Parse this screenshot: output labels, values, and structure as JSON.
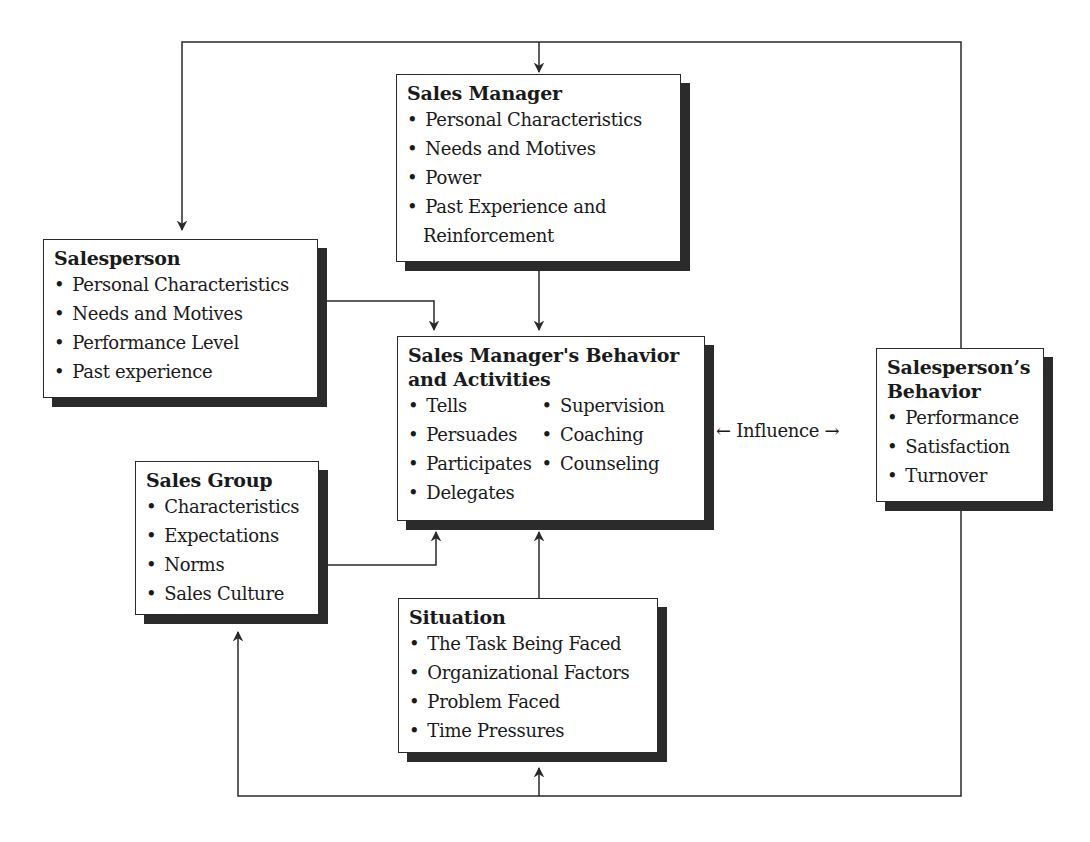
{
  "diagram": {
    "nodes": {
      "sales_manager": {
        "title": "Sales Manager",
        "items": [
          "Personal Characteristics",
          "Needs and Motives",
          "Power",
          "Past Experience and",
          "Reinforcement"
        ]
      },
      "salesperson": {
        "title": "Salesperson",
        "items": [
          "Personal Characteristics",
          "Needs and Motives",
          "Performance Level",
          "Past experience"
        ]
      },
      "manager_behavior": {
        "title_line1": "Sales Manager's Behavior",
        "title_line2": "and Activities",
        "items_left": [
          "Tells",
          "Persuades",
          "Participates",
          "Delegates"
        ],
        "items_right": [
          "Supervision",
          "Coaching",
          "Counseling"
        ]
      },
      "salesperson_behavior": {
        "title_line1": "Salesperson’s",
        "title_line2": "Behavior",
        "items": [
          "Performance",
          "Satisfaction",
          "Turnover"
        ]
      },
      "sales_group": {
        "title": "Sales Group",
        "items": [
          "Characteristics",
          "Expectations",
          "Norms",
          "Sales Culture"
        ]
      },
      "situation": {
        "title": "Situation",
        "items": [
          "The Task Being Faced",
          "Organizational Factors",
          "Problem Faced",
          "Time Pressures"
        ]
      }
    },
    "influence_label": "← Influence →",
    "edges": [
      {
        "from": "salesperson_behavior",
        "to": "sales_manager",
        "type": "feedback-top"
      },
      {
        "from": "salesperson_behavior",
        "to": "salesperson",
        "type": "feedback-top"
      },
      {
        "from": "sales_manager",
        "to": "manager_behavior"
      },
      {
        "from": "salesperson",
        "to": "manager_behavior"
      },
      {
        "from": "sales_group",
        "to": "manager_behavior"
      },
      {
        "from": "situation",
        "to": "manager_behavior"
      },
      {
        "from": "manager_behavior",
        "to": "salesperson_behavior",
        "label": "Influence",
        "bidirectional": true
      },
      {
        "from": "salesperson_behavior",
        "to": "sales_group",
        "type": "feedback-bottom"
      },
      {
        "from": "salesperson_behavior",
        "to": "situation",
        "type": "feedback-bottom"
      }
    ]
  },
  "colors": {
    "line": "#2a2a2a",
    "shadow": "#2b2b2b",
    "background": "#ffffff"
  }
}
